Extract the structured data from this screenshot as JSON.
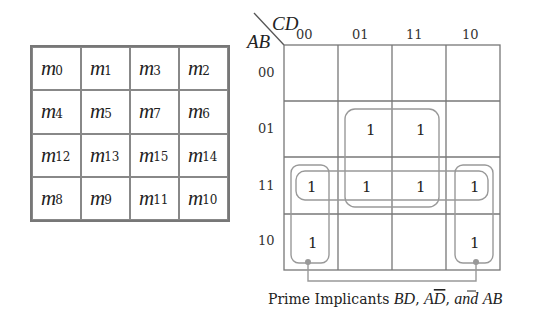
{
  "minterm_grid": {
    "prefix": "m",
    "rows": [
      [
        "0",
        "1",
        "3",
        "2"
      ],
      [
        "4",
        "5",
        "7",
        "6"
      ],
      [
        "12",
        "13",
        "15",
        "14"
      ],
      [
        "8",
        "9",
        "11",
        "10"
      ]
    ]
  },
  "kmap": {
    "row_var": "AB",
    "col_var": "CD",
    "col_labels": [
      "00",
      "01",
      "11",
      "10"
    ],
    "row_labels": [
      "00",
      "01",
      "11",
      "10"
    ],
    "cells": [
      [
        "",
        "",
        "",
        ""
      ],
      [
        "",
        "1",
        "1",
        ""
      ],
      [
        "1",
        "1",
        "1",
        "1"
      ],
      [
        "1",
        "",
        "",
        "1"
      ]
    ],
    "groups": [
      "BD",
      "AB",
      "AD̄ (wrap-around columns 00 and 10, rows 11 and 10)"
    ],
    "colors": {
      "grid": "#777777",
      "group": "#999999"
    }
  },
  "caption": {
    "prefix": "Prime Implicants ",
    "term1": "BD",
    "sep1": ", ",
    "term2_a": "A",
    "term2_b": "D",
    "sep2": ", ",
    "and": "and",
    "space": " ",
    "term3": "AB"
  }
}
